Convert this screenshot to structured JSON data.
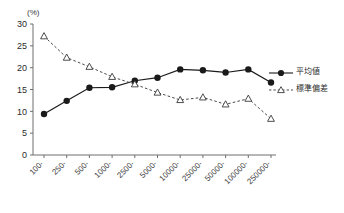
{
  "chart_data": {
    "type": "line",
    "title": "",
    "xlabel": "",
    "ylabel": "(%)",
    "unit_label": "(%)",
    "categories": [
      "100-",
      "250-",
      "500-",
      "1000-",
      "2500-",
      "5000-",
      "10000-",
      "25000-",
      "50000-",
      "100000-",
      "250000-"
    ],
    "ylim": [
      0,
      30
    ],
    "ytick_labels": [
      "0",
      "5",
      "10",
      "15",
      "20",
      "25",
      "30"
    ],
    "ytick_values": [
      0,
      5,
      10,
      15,
      20,
      25,
      30
    ],
    "grid": false,
    "legend_position": "right",
    "series": [
      {
        "name": "平均値",
        "marker": "filled-circle",
        "line_style": "solid",
        "color": "#1a1a1a",
        "values": [
          9.4,
          12.4,
          15.4,
          15.5,
          17.0,
          17.7,
          19.6,
          19.4,
          18.9,
          19.6,
          16.6
        ]
      },
      {
        "name": "標準偏差",
        "marker": "open-triangle",
        "line_style": "dashed",
        "color": "#4a4a4a",
        "values": [
          27.2,
          22.3,
          20.2,
          17.9,
          16.2,
          14.3,
          12.6,
          13.2,
          11.6,
          12.9,
          8.3
        ]
      }
    ]
  },
  "legend": {
    "items": [
      {
        "label": "平均値",
        "marker": "filled-circle",
        "style": "solid"
      },
      {
        "label": "標準偏差",
        "marker": "open-triangle",
        "style": "dashed"
      }
    ]
  }
}
